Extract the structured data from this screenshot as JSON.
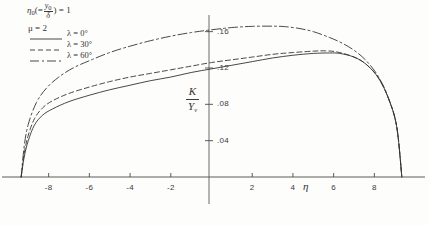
{
  "annotation": {
    "eta_symbol": "η",
    "eta_subscript": "0",
    "eta_open": "(=",
    "frac_num": "y",
    "frac_num_sub": "0",
    "frac_den": "δ",
    "eta_close": ") = 1",
    "mu_line": "μ = 2"
  },
  "legend": {
    "items": [
      {
        "label": "λ = 0°",
        "style": "solid",
        "color": "#33332f",
        "dash": "none"
      },
      {
        "label": "λ = 30°",
        "style": "dashed",
        "color": "#33332f",
        "dash": "5,3"
      },
      {
        "label": "λ = 60°",
        "style": "dash-dot",
        "color": "#33332f",
        "dash": "9,3,2,3"
      }
    ]
  },
  "axis_labels": {
    "x": "η",
    "y_numerator": "K",
    "y_denominator": "Y",
    "y_denominator_sub": "v"
  },
  "chart_data": {
    "type": "line",
    "title": "",
    "xlabel": "η",
    "ylabel": "K / Y_v",
    "xlim": [
      -9.8,
      9.8
    ],
    "ylim": [
      0,
      0.175
    ],
    "grid": false,
    "legend_position": "top-left",
    "xticks": [
      -8,
      -6,
      -4,
      -2,
      2,
      4,
      6,
      8
    ],
    "xtick_labels": [
      "-8",
      "-6",
      "-4",
      "-2",
      "2",
      "4",
      "6",
      "8"
    ],
    "yticks": [
      0.04,
      0.08,
      0.12,
      0.16
    ],
    "ytick_labels": [
      ".04",
      ".08",
      ".12",
      ".16"
    ],
    "annotations": [
      "η₀(= y₀/δ) = 1",
      "μ = 2"
    ],
    "series": [
      {
        "name": "λ = 0°",
        "style": "solid",
        "x": [
          -9.35,
          -9.2,
          -9.0,
          -8.7,
          -8.3,
          -7.8,
          -7.0,
          -6.0,
          -5.0,
          -4.0,
          -3.0,
          -2.0,
          -1.0,
          0.0,
          1.0,
          2.0,
          3.0,
          4.0,
          5.0,
          5.8,
          6.3,
          7.0,
          7.6,
          8.2,
          8.7,
          9.1,
          9.35
        ],
        "y": [
          0.0,
          0.022,
          0.04,
          0.057,
          0.068,
          0.075,
          0.083,
          0.09,
          0.096,
          0.101,
          0.106,
          0.11,
          0.115,
          0.119,
          0.123,
          0.127,
          0.131,
          0.134,
          0.136,
          0.1365,
          0.136,
          0.132,
          0.124,
          0.109,
          0.086,
          0.055,
          0.0
        ]
      },
      {
        "name": "λ = 30°",
        "style": "dashed",
        "x": [
          -9.35,
          -9.2,
          -9.0,
          -8.7,
          -8.3,
          -7.8,
          -7.0,
          -6.0,
          -5.0,
          -4.0,
          -3.0,
          -2.0,
          -1.0,
          0.0,
          1.0,
          2.0,
          3.0,
          4.0,
          5.0,
          5.6,
          6.2,
          7.0,
          7.6,
          8.2,
          8.7,
          9.1,
          9.35
        ],
        "y": [
          0.0,
          0.026,
          0.046,
          0.064,
          0.076,
          0.084,
          0.092,
          0.099,
          0.105,
          0.11,
          0.114,
          0.118,
          0.122,
          0.126,
          0.129,
          0.132,
          0.135,
          0.137,
          0.1385,
          0.1388,
          0.1375,
          0.132,
          0.124,
          0.109,
          0.086,
          0.055,
          0.0
        ]
      },
      {
        "name": "λ = 60°",
        "style": "dash-dot",
        "x": [
          -9.35,
          -9.2,
          -9.0,
          -8.6,
          -8.1,
          -7.5,
          -6.8,
          -6.0,
          -5.0,
          -4.0,
          -3.0,
          -2.0,
          -1.0,
          0.0,
          1.0,
          2.0,
          3.0,
          3.6,
          4.3,
          5.0,
          5.8,
          6.4,
          7.0,
          7.6,
          8.2,
          8.7,
          9.1,
          9.35
        ],
        "y": [
          0.0,
          0.034,
          0.058,
          0.082,
          0.098,
          0.11,
          0.12,
          0.128,
          0.137,
          0.144,
          0.15,
          0.155,
          0.159,
          0.162,
          0.1645,
          0.1658,
          0.166,
          0.1655,
          0.1635,
          0.16,
          0.1535,
          0.1475,
          0.1395,
          0.128,
          0.1105,
          0.0865,
          0.0555,
          0.0
        ]
      }
    ]
  },
  "plot_geometry": {
    "x_pixel_min": 12,
    "x_pixel_max": 411,
    "y_pixel_zero": 177,
    "y_pixel_top": 18,
    "y_axis_pixel": 209,
    "data_x_min": -9.8,
    "data_x_max": 9.8,
    "data_y_min": 0,
    "data_y_max": 0.175
  }
}
